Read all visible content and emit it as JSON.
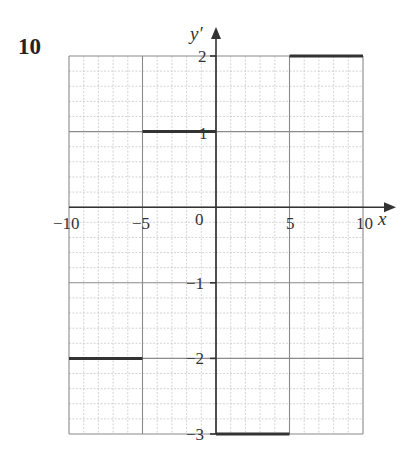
{
  "problem_number": "10",
  "chart_data": {
    "type": "line",
    "subtype": "step",
    "title": "",
    "xlabel": "x",
    "ylabel": "y′",
    "xlim": [
      -10,
      10
    ],
    "ylim": [
      -3,
      2
    ],
    "grid": true,
    "x_ticks": [
      "-10",
      "-5",
      "0",
      "5",
      "10"
    ],
    "y_ticks": [
      "2",
      "1",
      "-1",
      "-2",
      "-3"
    ],
    "segments": [
      {
        "x_start": -10,
        "x_end": -5,
        "y": -2
      },
      {
        "x_start": -5,
        "x_end": 0,
        "y": 1
      },
      {
        "x_start": 0,
        "x_end": 5,
        "y": -3
      },
      {
        "x_start": 5,
        "x_end": 10,
        "y": 2
      }
    ],
    "line_color": "#333333"
  },
  "labels": {
    "x_axis": "x",
    "y_axis": "y′",
    "x_ticks": [
      "−10",
      "−5",
      "0",
      "5",
      "10"
    ],
    "y_ticks": [
      "2",
      "1",
      "−1",
      "−2",
      "−3"
    ]
  }
}
